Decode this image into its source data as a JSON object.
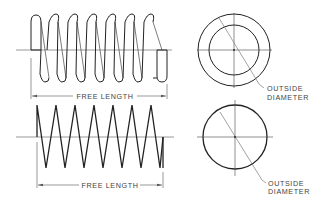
{
  "figure": {
    "colors": {
      "line": "#222222",
      "thin": "#555555",
      "text": "#444444",
      "background": "#ffffff"
    }
  },
  "top_view": {
    "dimension_label": "FREE LENGTH",
    "callout_line1": "OUTSIDE",
    "callout_line2": "DIAMETER",
    "coils": 7
  },
  "bottom_view": {
    "dimension_label": "FREE LENGTH",
    "callout_line1": "OUTSIDE",
    "callout_line2": "DIAMETER",
    "coils": 7
  }
}
